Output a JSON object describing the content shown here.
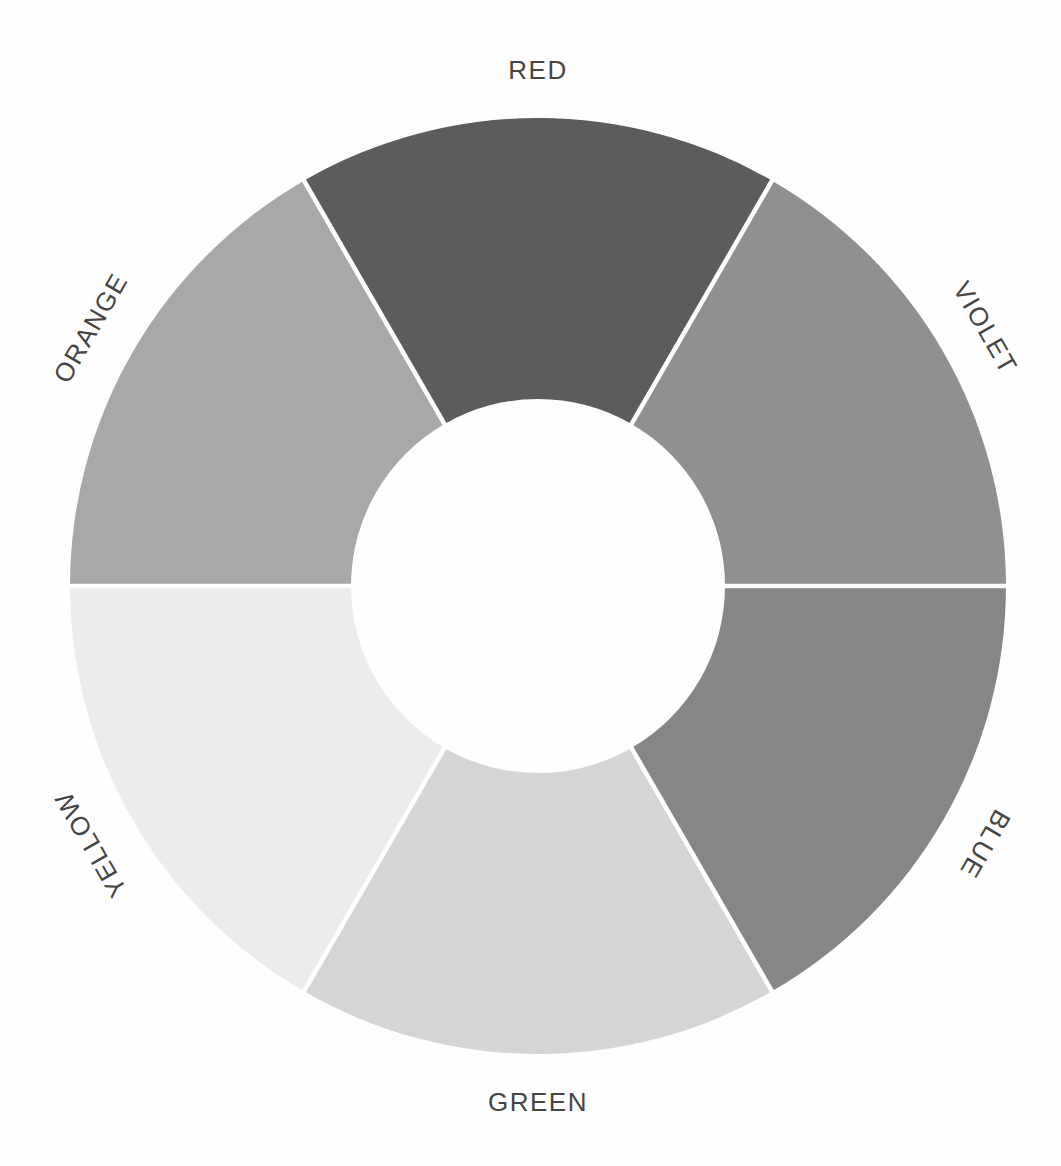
{
  "chart_data": {
    "type": "pie",
    "subtype": "donut-color-wheel",
    "title": "",
    "legend": "none",
    "segments": [
      {
        "label": "RED",
        "value": 60,
        "color": "#5c5c5c",
        "mid_angle_deg": 0,
        "label_rotation_deg": 0
      },
      {
        "label": "VIOLET",
        "value": 60,
        "color": "#909090",
        "mid_angle_deg": 60,
        "label_rotation_deg": 60
      },
      {
        "label": "BLUE",
        "value": 60,
        "color": "#868686",
        "mid_angle_deg": 120,
        "label_rotation_deg": 120
      },
      {
        "label": "GREEN",
        "value": 60,
        "color": "#d5d5d5",
        "mid_angle_deg": 180,
        "label_rotation_deg": 0
      },
      {
        "label": "YELLOW",
        "value": 60,
        "color": "#ececec",
        "mid_angle_deg": 240,
        "label_rotation_deg": -120
      },
      {
        "label": "ORANGE",
        "value": 60,
        "color": "#a8a8a8",
        "mid_angle_deg": 300,
        "label_rotation_deg": -60
      }
    ],
    "geometry": {
      "center_x": 538,
      "center_y": 586,
      "outer_radius": 468,
      "inner_radius": 187,
      "label_radius": 516,
      "divider_color": "#ffffff",
      "divider_width": 4.5
    },
    "background_color": "#fefefe",
    "label_color": "#454545"
  }
}
